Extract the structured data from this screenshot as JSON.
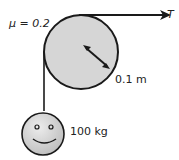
{
  "diagram": {
    "mu_label": "μ = 0.2",
    "tension_label": "T",
    "radius_label": "0.1 m",
    "mass_label": "100 kg",
    "colors": {
      "pulley_fill": "#d4d4d4",
      "mass_fill": "#c8c8c8",
      "stroke": "#1a1a1a"
    }
  }
}
